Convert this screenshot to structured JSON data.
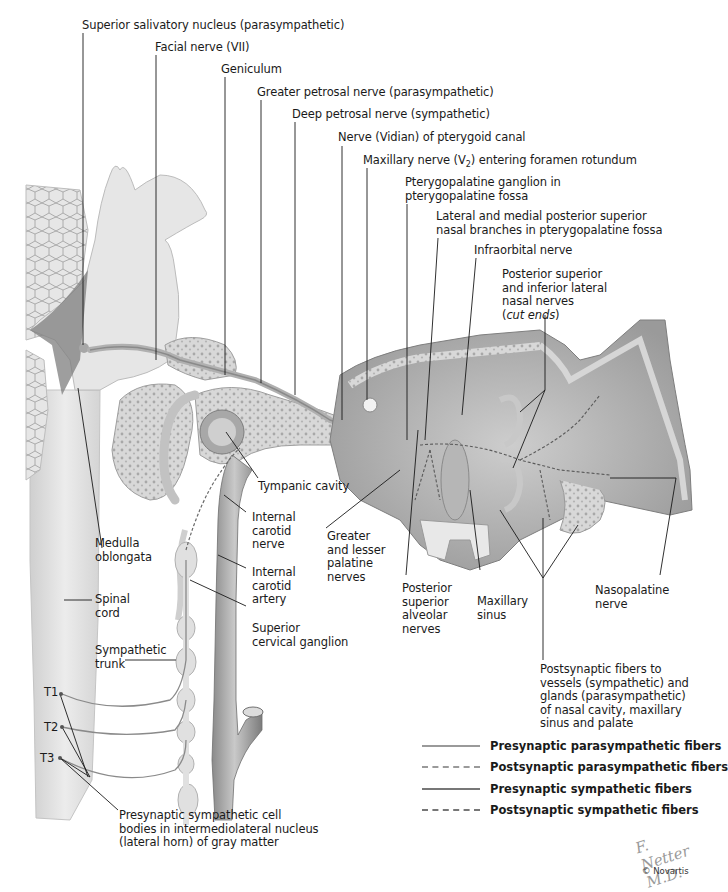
{
  "figure": {
    "type": "anatomical-illustration"
  },
  "labels": {
    "superior_salivatory_nucleus": "Superior salivatory nucleus (parasympathetic)",
    "facial_nerve": "Facial nerve (VII)",
    "geniculum": "Geniculum",
    "greater_petrosal_nerve": "Greater petrosal nerve (parasympathetic)",
    "deep_petrosal_nerve": "Deep petrosal nerve (sympathetic)",
    "vidian_nerve": "Nerve (Vidian) of pterygoid canal",
    "maxillary_nerve_pre": "Maxillary nerve (V",
    "maxillary_nerve_sub": "2",
    "maxillary_nerve_post": ") entering foramen rotundum",
    "pterygopalatine_ganglion_1": "Pterygopalatine ganglion in",
    "pterygopalatine_ganglion_2": "pterygopalatine fossa",
    "lateral_medial_nasal_1": "Lateral and medial posterior superior",
    "lateral_medial_nasal_2": "nasal branches in pterygopalatine fossa",
    "infraorbital_nerve": "Infraorbital nerve",
    "post_sup_inf_1": "Posterior superior",
    "post_sup_inf_2": "and inferior lateral",
    "post_sup_inf_3": "nasal nerves",
    "post_sup_inf_4_open": "(",
    "post_sup_inf_4_italic": "cut ends",
    "post_sup_inf_4_close": ")",
    "tympanic_cavity": "Tympanic cavity",
    "medulla_1": "Medulla",
    "medulla_2": "oblongata",
    "internal_carotid_nerve_1": "Internal",
    "internal_carotid_nerve_2": "carotid",
    "internal_carotid_nerve_3": "nerve",
    "internal_carotid_artery_1": "Internal",
    "internal_carotid_artery_2": "carotid",
    "internal_carotid_artery_3": "artery",
    "greater_lesser_palatine_1": "Greater",
    "greater_lesser_palatine_2": "and lesser",
    "greater_lesser_palatine_3": "palatine",
    "greater_lesser_palatine_4": "nerves",
    "post_sup_alveolar_1": "Posterior",
    "post_sup_alveolar_2": "superior",
    "post_sup_alveolar_3": "alveolar",
    "post_sup_alveolar_4": "nerves",
    "maxillary_sinus_1": "Maxillary",
    "maxillary_sinus_2": "sinus",
    "nasopalatine_1": "Nasopalatine",
    "nasopalatine_2": "nerve",
    "spinal_cord_1": "Spinal",
    "spinal_cord_2": "cord",
    "superior_cervical_ganglion_1": "Superior",
    "superior_cervical_ganglion_2": "cervical ganglion",
    "sympathetic_trunk_1": "Sympathetic",
    "sympathetic_trunk_2": "trunk",
    "t1": "T1",
    "t2": "T2",
    "t3": "T3",
    "postsynaptic_fibers_1": "Postsynaptic fibers to",
    "postsynaptic_fibers_2": "vessels (sympathetic) and",
    "postsynaptic_fibers_3": "glands (parasympathetic)",
    "postsynaptic_fibers_4": "of nasal cavity, maxillary",
    "postsynaptic_fibers_5": "sinus and palate",
    "presynaptic_cell_bodies_1": "Presynaptic sympathetic cell",
    "presynaptic_cell_bodies_2": "bodies in intermediolateral nucleus",
    "presynaptic_cell_bodies_3": "(lateral horn) of gray matter"
  },
  "legend": {
    "items": [
      {
        "label": "Presynaptic parasympathetic fibers",
        "style": "solid",
        "color": "#9a9a9a"
      },
      {
        "label": "Postsynaptic parasympathetic fibers",
        "style": "dashed",
        "color": "#9a9a9a"
      },
      {
        "label": "Presynaptic sympathetic fibers",
        "style": "solid",
        "color": "#777777"
      },
      {
        "label": "Postsynaptic sympathetic fibers",
        "style": "dashed",
        "color": "#777777"
      }
    ]
  },
  "credits": {
    "signature": "F. Netter M.D.",
    "copyright": "© Novartis"
  },
  "colors": {
    "tissue_light": "#e4e4e4",
    "tissue_mid": "#c8c8c8",
    "tissue_dark": "#8c8c8c",
    "bone": "#d6d6d6",
    "leader_line": "#1a1a1a"
  }
}
